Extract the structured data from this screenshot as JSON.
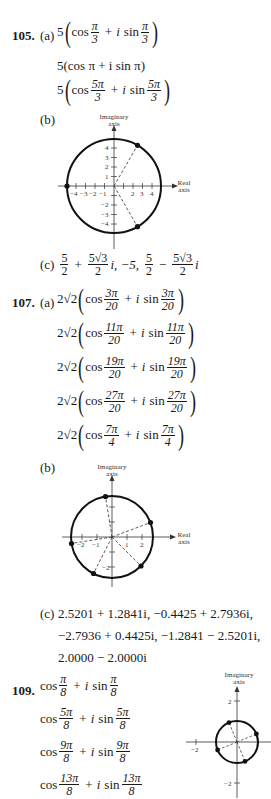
{
  "problems": [
    {
      "number": "105.",
      "part_a_label": "(a)",
      "part_a": [
        {
          "coef": "5",
          "paren": true,
          "cos_n": "π",
          "cos_d": "3",
          "sin_n": "π",
          "sin_d": "3"
        },
        {
          "text": "5(cos π + i sin π)"
        },
        {
          "coef": "5",
          "paren": true,
          "cos_n": "5π",
          "cos_d": "3",
          "sin_n": "5π",
          "sin_d": "3"
        }
      ],
      "part_b_label": "(b)",
      "part_c_label": "(c)",
      "part_c": {
        "t1_n": "5",
        "t1_d": "2",
        "plus": "+",
        "t2_n": "5√3",
        "t2_d": "2",
        "sep1": "i, −5,",
        "t3_n": "5",
        "t3_d": "2",
        "minus": "−",
        "t4_n": "5√3",
        "t4_d": "2",
        "tail": "i"
      }
    },
    {
      "number": "107.",
      "part_a_label": "(a)",
      "part_a": [
        {
          "coef": "2√2",
          "cos_n": "3π",
          "cos_d": "20",
          "sin_n": "3π",
          "sin_d": "20"
        },
        {
          "coef": "2√2",
          "cos_n": "11π",
          "cos_d": "20",
          "sin_n": "11π",
          "sin_d": "20"
        },
        {
          "coef": "2√2",
          "cos_n": "19π",
          "cos_d": "20",
          "sin_n": "19π",
          "sin_d": "20"
        },
        {
          "coef": "2√2",
          "cos_n": "27π",
          "cos_d": "20",
          "sin_n": "27π",
          "sin_d": "20"
        },
        {
          "coef": "2√2",
          "cos_n": "7π",
          "cos_d": "4",
          "sin_n": "7π",
          "sin_d": "4"
        }
      ],
      "part_b_label": "(b)",
      "part_c_label": "(c)",
      "part_c_lines": [
        "2.5201 + 1.2841i, −0.4425 + 2.7936i,",
        "−2.7936 + 0.4425i, −1.2841 − 2.5201i,",
        "2.0000 − 2.0000i"
      ]
    },
    {
      "number": "109.",
      "lines": [
        {
          "cos_n": "π",
          "cos_d": "8",
          "sin_n": "π",
          "sin_d": "8"
        },
        {
          "cos_n": "5π",
          "cos_d": "8",
          "sin_n": "5π",
          "sin_d": "8"
        },
        {
          "cos_n": "9π",
          "cos_d": "8",
          "sin_n": "9π",
          "sin_d": "8"
        },
        {
          "cos_n": "13π",
          "cos_d": "8",
          "sin_n": "13π",
          "sin_d": "8"
        }
      ]
    }
  ],
  "words": {
    "cos": "cos",
    "sin": "sin",
    "i": "i",
    "plus": "+"
  },
  "graphs": {
    "imag_label_1": "Imaginary",
    "imag_label_2": "axis",
    "real_label_1": "Real",
    "real_label_2": "axis",
    "g105_ticks": [
      "−4",
      "−3",
      "−2",
      "−1",
      "2",
      "3",
      "4",
      "4",
      "3",
      "2",
      "1",
      "−2",
      "−3",
      "−4"
    ],
    "g107_ticks": [
      "−2",
      "−1",
      "1",
      "2",
      "−2"
    ],
    "g109_ticks": [
      "2",
      "−2",
      "−2"
    ]
  }
}
